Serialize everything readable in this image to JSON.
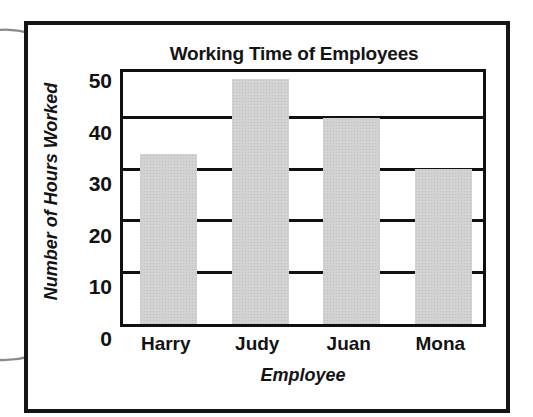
{
  "chart_data": {
    "type": "bar",
    "title": "Working Time of Employees",
    "xlabel": "Employee",
    "ylabel": "Number of Hours Worked",
    "categories": [
      "Harry",
      "Judy",
      "Juan",
      "Mona"
    ],
    "values": [
      33,
      47.5,
      40,
      30
    ],
    "ylim": [
      0,
      50
    ],
    "yticks": [
      0,
      10,
      20,
      30,
      40,
      50
    ],
    "ytick_labels": [
      "0",
      "10",
      "20",
      "30",
      "40",
      "50"
    ],
    "grid": true,
    "legend": false,
    "bar_color": "#d2d2d2",
    "axis_color": "#111111"
  },
  "annotations": {
    "arrow_top": "curved-arrow-pointing-right",
    "arrow_bottom": "curved-arrow-pointing-right",
    "arrow_color": "#8a8a8a"
  },
  "frame": {
    "border_color": "#151515"
  }
}
